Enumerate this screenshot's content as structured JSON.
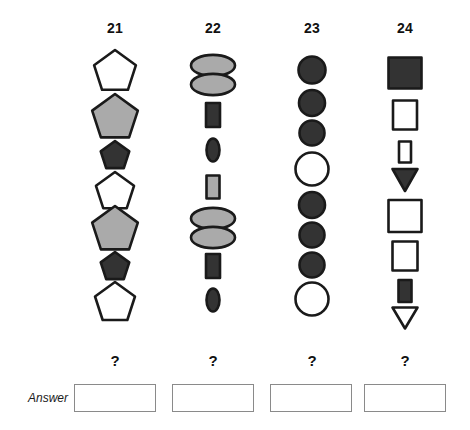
{
  "page": {
    "background": "#ffffff",
    "width": 470,
    "height": 430
  },
  "palette": {
    "outline": "#1a1a1a",
    "dark_fill": "#333333",
    "gray_fill": "#aaaaaa",
    "white_fill": "#ffffff",
    "answer_border": "#8a8a8a",
    "text": "#111111"
  },
  "answer_row": {
    "label": "Answer",
    "boxes": [
      {
        "name": "answer-box-21",
        "value": ""
      },
      {
        "name": "answer-box-22",
        "value": ""
      },
      {
        "name": "answer-box-23",
        "value": ""
      },
      {
        "name": "answer-box-24",
        "value": ""
      }
    ],
    "question_marks": [
      "?",
      "?",
      "?",
      "?"
    ]
  },
  "columns": [
    {
      "header": "21",
      "center_x": 115,
      "shape_family": "pentagon",
      "question_mark": "?",
      "items": [
        {
          "shape": "pentagon",
          "fill": "white",
          "size": 44,
          "cy": 72
        },
        {
          "shape": "pentagon",
          "fill": "gray",
          "size": 48,
          "cy": 118
        },
        {
          "shape": "pentagon",
          "fill": "dark",
          "size": 30,
          "cy": 156
        },
        {
          "shape": "pentagon",
          "fill": "white",
          "size": 40,
          "cy": 192
        },
        {
          "shape": "pentagon",
          "fill": "gray",
          "size": 48,
          "cy": 230
        },
        {
          "shape": "pentagon",
          "fill": "dark",
          "size": 30,
          "cy": 267
        },
        {
          "shape": "pentagon",
          "fill": "white",
          "size": 42,
          "cy": 303
        }
      ]
    },
    {
      "header": "22",
      "center_x": 213,
      "shape_family": "ellipse-rectangle",
      "question_mark": "?",
      "items": [
        {
          "shape": "double-ellipse",
          "fill": "gray",
          "w": 44,
          "h": 34,
          "cy": 75
        },
        {
          "shape": "rectangle",
          "fill": "dark",
          "w": 14,
          "h": 24,
          "cy": 115
        },
        {
          "shape": "ellipse",
          "fill": "dark",
          "w": 13,
          "h": 23,
          "cy": 150
        },
        {
          "shape": "rectangle",
          "fill": "gray",
          "w": 13,
          "h": 23,
          "cy": 187
        },
        {
          "shape": "double-ellipse",
          "fill": "gray",
          "w": 44,
          "h": 34,
          "cy": 228
        },
        {
          "shape": "rectangle",
          "fill": "dark",
          "w": 14,
          "h": 24,
          "cy": 266
        },
        {
          "shape": "ellipse",
          "fill": "dark",
          "w": 13,
          "h": 23,
          "cy": 300
        }
      ]
    },
    {
      "header": "23",
      "center_x": 312,
      "shape_family": "circle",
      "question_mark": "?",
      "items": [
        {
          "shape": "circle",
          "fill": "dark",
          "d": 27,
          "cy": 70
        },
        {
          "shape": "circle",
          "fill": "dark",
          "d": 26,
          "cy": 103
        },
        {
          "shape": "circle",
          "fill": "dark",
          "d": 25,
          "cy": 133
        },
        {
          "shape": "circle",
          "fill": "white",
          "d": 33,
          "cy": 169
        },
        {
          "shape": "circle",
          "fill": "dark",
          "d": 26,
          "cy": 205
        },
        {
          "shape": "circle",
          "fill": "dark",
          "d": 25,
          "cy": 235
        },
        {
          "shape": "circle",
          "fill": "dark",
          "d": 25,
          "cy": 265
        },
        {
          "shape": "circle",
          "fill": "white",
          "d": 33,
          "cy": 299
        }
      ]
    },
    {
      "header": "24",
      "center_x": 405,
      "shape_family": "square-triangle",
      "question_mark": "?",
      "items": [
        {
          "shape": "square",
          "fill": "dark",
          "w": 33,
          "h": 31,
          "cy": 73
        },
        {
          "shape": "rectangle",
          "fill": "white",
          "w": 24,
          "h": 29,
          "cy": 115
        },
        {
          "shape": "rectangle",
          "fill": "white",
          "w": 12,
          "h": 21,
          "cy": 152
        },
        {
          "shape": "triangle-down",
          "fill": "dark",
          "w": 25,
          "h": 22,
          "cy": 180
        },
        {
          "shape": "square",
          "fill": "white",
          "w": 33,
          "h": 32,
          "cy": 216
        },
        {
          "shape": "rectangle",
          "fill": "white",
          "w": 25,
          "h": 29,
          "cy": 256
        },
        {
          "shape": "rectangle",
          "fill": "dark",
          "w": 13,
          "h": 22,
          "cy": 291
        },
        {
          "shape": "triangle-down",
          "fill": "white",
          "w": 25,
          "h": 21,
          "cy": 318
        }
      ]
    }
  ]
}
